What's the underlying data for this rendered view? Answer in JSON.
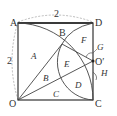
{
  "diagram": {
    "points": {
      "A": "A",
      "D": "D",
      "O": "O",
      "C": "C",
      "B": "B",
      "O_prime": "O′"
    },
    "regions": {
      "A": "A",
      "B": "B",
      "C": "C",
      "D": "D",
      "E": "E",
      "F": "F"
    },
    "callouts": {
      "G": "G",
      "H": "H"
    },
    "dimensions": {
      "top": "2",
      "left": "2"
    }
  }
}
